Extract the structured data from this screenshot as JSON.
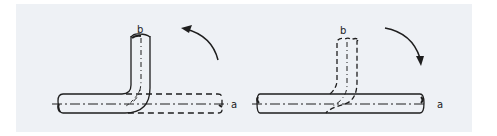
{
  "figure": {
    "background_color": "#eef1f5",
    "line_color": "#1e1e1e",
    "left_diagram": {
      "axis_labels": {
        "a": "a",
        "b": "b"
      },
      "arrow_direction": "counter-clockwise",
      "description": "Bent pipe, leg b upright (solid), straight position along axis a shown dashed"
    },
    "right_diagram": {
      "axis_labels": {
        "a": "a",
        "b": "b"
      },
      "arrow_direction": "clockwise",
      "description": "Straight pipe along axis a (solid), bent position with leg b shown dashed"
    }
  }
}
